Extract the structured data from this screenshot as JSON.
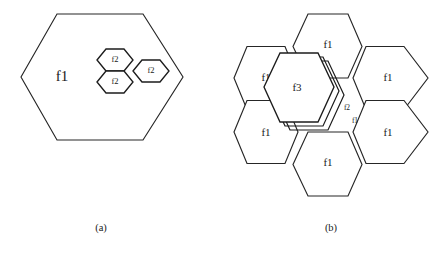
{
  "figure": {
    "background_color": "#ffffff",
    "line_color": "#262626",
    "text_color": "#1a1a1a"
  },
  "panel_a": {
    "caption": "(a)",
    "outer_hexagon": {
      "label": "f1"
    },
    "inner_hexagons": [
      {
        "label": "f2",
        "position": "upper-left"
      },
      {
        "label": "f2",
        "position": "lower-left"
      },
      {
        "label": "f2",
        "position": "right"
      }
    ]
  },
  "panel_b": {
    "caption": "(b)",
    "outer_hexagons": [
      {
        "label": "f1",
        "position": "top"
      },
      {
        "label": "f1",
        "position": "upper-left"
      },
      {
        "label": "f1",
        "position": "upper-right"
      },
      {
        "label": "f1",
        "position": "lower-left"
      },
      {
        "label": "f1",
        "position": "lower-right"
      },
      {
        "label": "f1",
        "position": "bottom"
      }
    ],
    "center_hexagons": [
      {
        "label": "f3",
        "position": "center-front"
      },
      {
        "label": "f2",
        "position": "center-offset"
      },
      {
        "label": "f1",
        "position": "center-offset-2"
      }
    ]
  }
}
